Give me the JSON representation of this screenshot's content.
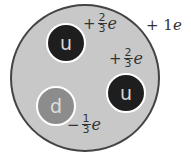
{
  "diagram": {
    "total_charge": {
      "sign": "+",
      "value": "1",
      "unit": "e"
    },
    "quarks": [
      {
        "label": "u",
        "type": "up",
        "charge": {
          "sign": "+",
          "num": "2",
          "den": "3",
          "unit": "e"
        }
      },
      {
        "label": "u",
        "type": "up",
        "charge": {
          "sign": "+",
          "num": "2",
          "den": "3",
          "unit": "e"
        }
      },
      {
        "label": "d",
        "type": "down",
        "charge": {
          "sign": "−",
          "num": "1",
          "den": "3",
          "unit": "e"
        }
      }
    ],
    "colors": {
      "proton_fill": "#c8c8c8",
      "proton_border": "#444444",
      "up_quark": "#1e1e1e",
      "down_quark": "#8c8c8c",
      "quark_border": "#ffffff",
      "text": "#333333"
    }
  }
}
